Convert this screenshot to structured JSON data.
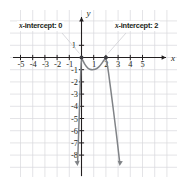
{
  "figure": {
    "type": "coordinate-graph",
    "background": "#ffffff",
    "grid_color": "#d8d8dd",
    "axis_color": "#231f20",
    "curve_color": "#808387"
  },
  "annotations": {
    "left": {
      "prefix": "x",
      "text": "-intercept: 0",
      "value": 0
    },
    "right": {
      "prefix": "x",
      "text": "-intercept: 2",
      "value": 2
    }
  },
  "axis_labels": {
    "x": "x",
    "y": "y"
  },
  "ticks": {
    "x": [
      "-5",
      "-4",
      "-3",
      "-2",
      "-1",
      "1",
      "2",
      "3",
      "4",
      "5"
    ],
    "y": [
      "1",
      "-1",
      "-2",
      "-3",
      "-4",
      "-5",
      "-6",
      "-7",
      "-8"
    ]
  },
  "chart_data": {
    "type": "line",
    "title": "",
    "xlabel": "x",
    "ylabel": "y",
    "xlim": [
      -5.8,
      5.8
    ],
    "ylim": [
      -8.8,
      1.8
    ],
    "grid": true,
    "legend": "none",
    "x_ticks": [
      -5,
      -4,
      -3,
      -2,
      -1,
      1,
      2,
      3,
      4,
      5
    ],
    "y_ticks": [
      1,
      -1,
      -2,
      -3,
      -4,
      -5,
      -6,
      -7,
      -8
    ],
    "x_intercepts": [
      0,
      2
    ],
    "intercept_points": [
      {
        "x": 0,
        "y": 0
      },
      {
        "x": 2,
        "y": 0
      }
    ],
    "local_minimum": {
      "x": 1.0,
      "y": -1.0
    },
    "series": [
      {
        "name": "curve",
        "color": "#808387",
        "arrow_start": true,
        "arrow_end": true,
        "points": [
          {
            "x": -0.32,
            "y": -8.6
          },
          {
            "x": -0.26,
            "y": -7.0
          },
          {
            "x": -0.2,
            "y": -5.2
          },
          {
            "x": -0.15,
            "y": -3.6
          },
          {
            "x": -0.1,
            "y": -2.2
          },
          {
            "x": -0.05,
            "y": -0.9
          },
          {
            "x": 0.0,
            "y": 0.0
          },
          {
            "x": 0.25,
            "y": -0.55
          },
          {
            "x": 0.55,
            "y": -0.92
          },
          {
            "x": 0.8,
            "y": -1.0
          },
          {
            "x": 1.0,
            "y": -1.0
          },
          {
            "x": 1.25,
            "y": -0.93
          },
          {
            "x": 1.55,
            "y": -0.65
          },
          {
            "x": 1.8,
            "y": -0.28
          },
          {
            "x": 2.0,
            "y": 0.0
          },
          {
            "x": 2.15,
            "y": -0.75
          },
          {
            "x": 2.3,
            "y": -1.9
          },
          {
            "x": 2.5,
            "y": -3.4
          },
          {
            "x": 2.7,
            "y": -5.0
          },
          {
            "x": 2.9,
            "y": -6.6
          },
          {
            "x": 3.05,
            "y": -7.9
          },
          {
            "x": 3.13,
            "y": -8.6
          }
        ]
      }
    ]
  }
}
